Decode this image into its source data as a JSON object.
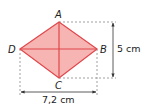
{
  "figure": {
    "type": "rhombus",
    "vertices": {
      "A": {
        "label": "A",
        "x": 59,
        "y": 22
      },
      "B": {
        "label": "B",
        "x": 97,
        "y": 49
      },
      "C": {
        "label": "C",
        "x": 59,
        "y": 78
      },
      "D": {
        "label": "D",
        "x": 20,
        "y": 49
      }
    },
    "diagonals": [
      "AC",
      "DB"
    ],
    "fill_color": "#f4a8a4",
    "stroke_color": "#e0474c"
  },
  "measurements": {
    "vertical": {
      "label": "5 cm",
      "from": "A",
      "to": "C"
    },
    "horizontal": {
      "label": "7,2 cm",
      "from": "D",
      "to": "B"
    }
  },
  "colors": {
    "dash": "#888888",
    "arrow": "#333333"
  }
}
